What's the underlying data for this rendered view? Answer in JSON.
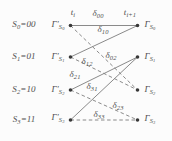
{
  "figure": {
    "background": "#fcfcfc",
    "colors": {
      "line": "#7d7d7d",
      "text": "#4f4f4f",
      "node": "#383838"
    },
    "node_radius": 1.8,
    "nodes": [
      {
        "name": "node-prev-s0",
        "x": 70.5,
        "y": 25.5
      },
      {
        "name": "node-prev-s1",
        "x": 70.5,
        "y": 57
      },
      {
        "name": "node-prev-s2",
        "x": 70.5,
        "y": 90
      },
      {
        "name": "node-prev-s3",
        "x": 70.5,
        "y": 120
      },
      {
        "name": "node-next-s0",
        "x": 137.5,
        "y": 25.5
      },
      {
        "name": "node-next-s1",
        "x": 137.5,
        "y": 57
      },
      {
        "name": "node-next-s2",
        "x": 137.5,
        "y": 90
      },
      {
        "name": "node-next-s3",
        "x": 137.5,
        "y": 120
      }
    ],
    "edges": [
      {
        "name": "branch-s0-s0",
        "metric": "δ00",
        "x1": 70.5,
        "y1": 25.5,
        "x2": 137.5,
        "y2": 25.5,
        "style": "solid"
      },
      {
        "name": "branch-s1-s0",
        "metric": "δ10",
        "x1": 70.5,
        "y1": 57,
        "x2": 137.5,
        "y2": 25.5,
        "style": "solid"
      },
      {
        "name": "branch-s0-s2",
        "metric": "δ02",
        "x1": 70.5,
        "y1": 25.5,
        "x2": 137.5,
        "y2": 90,
        "style": "dashed"
      },
      {
        "name": "branch-s1-s2",
        "metric": "δ12",
        "x1": 70.5,
        "y1": 57,
        "x2": 137.5,
        "y2": 90,
        "style": "dashed"
      },
      {
        "name": "branch-s2-s1",
        "metric": "δ21",
        "x1": 70.5,
        "y1": 90,
        "x2": 137.5,
        "y2": 57,
        "style": "solid"
      },
      {
        "name": "branch-s3-s1",
        "metric": "δ31",
        "x1": 70.5,
        "y1": 120,
        "x2": 137.5,
        "y2": 57,
        "style": "solid"
      },
      {
        "name": "branch-s2-s3",
        "metric": "δ23",
        "x1": 70.5,
        "y1": 90,
        "x2": 137.5,
        "y2": 120,
        "style": "dashed"
      },
      {
        "name": "branch-s3-s3",
        "metric": "δ33",
        "x1": 70.5,
        "y1": 120,
        "x2": 137.5,
        "y2": 120,
        "style": "dashed"
      }
    ],
    "labels": [
      {
        "name": "state-label-s0",
        "x": 24,
        "y": 25,
        "parts": [
          {
            "t": "S"
          },
          {
            "t": "0",
            "s": 1
          },
          {
            "t": "=00"
          }
        ]
      },
      {
        "name": "state-label-s1",
        "x": 24,
        "y": 57,
        "parts": [
          {
            "t": "S"
          },
          {
            "t": "1",
            "s": 1
          },
          {
            "t": "=01"
          }
        ]
      },
      {
        "name": "state-label-s2",
        "x": 24,
        "y": 90,
        "parts": [
          {
            "t": "S"
          },
          {
            "t": "2",
            "s": 1
          },
          {
            "t": "=10"
          }
        ]
      },
      {
        "name": "state-label-s3",
        "x": 24,
        "y": 120,
        "parts": [
          {
            "t": "S"
          },
          {
            "t": "3",
            "s": 1
          },
          {
            "t": "=11"
          }
        ]
      },
      {
        "name": "metric-prev-s0",
        "x": 58,
        "y": 26,
        "parts": [
          {
            "t": "Γ′"
          },
          {
            "t": "S",
            "s": 1
          },
          {
            "t": "0",
            "s": 2
          }
        ]
      },
      {
        "name": "metric-prev-s1",
        "x": 58,
        "y": 58,
        "parts": [
          {
            "t": "Γ′"
          },
          {
            "t": "S",
            "s": 1
          },
          {
            "t": "1",
            "s": 2
          }
        ]
      },
      {
        "name": "metric-prev-s2",
        "x": 58,
        "y": 91,
        "parts": [
          {
            "t": "Γ′"
          },
          {
            "t": "S",
            "s": 1
          },
          {
            "t": "2",
            "s": 2
          }
        ]
      },
      {
        "name": "metric-prev-s3",
        "x": 58,
        "y": 119,
        "parts": [
          {
            "t": "Γ′"
          },
          {
            "t": "S",
            "s": 1
          },
          {
            "t": "3",
            "s": 2
          }
        ]
      },
      {
        "name": "metric-next-s0",
        "x": 150,
        "y": 26,
        "parts": [
          {
            "t": "Γ"
          },
          {
            "t": "S",
            "s": 1
          },
          {
            "t": "0",
            "s": 2
          }
        ]
      },
      {
        "name": "metric-next-s1",
        "x": 150,
        "y": 58,
        "parts": [
          {
            "t": "Γ"
          },
          {
            "t": "S",
            "s": 1
          },
          {
            "t": "1",
            "s": 2
          }
        ]
      },
      {
        "name": "metric-next-s2",
        "x": 150,
        "y": 91,
        "parts": [
          {
            "t": "Γ"
          },
          {
            "t": "S",
            "s": 1
          },
          {
            "t": "2",
            "s": 2
          }
        ]
      },
      {
        "name": "metric-next-s3",
        "x": 150,
        "y": 120,
        "parts": [
          {
            "t": "Γ"
          },
          {
            "t": "S",
            "s": 1
          },
          {
            "t": "3",
            "s": 2
          }
        ]
      },
      {
        "name": "time-label-i",
        "x": 73,
        "y": 13,
        "parts": [
          {
            "t": "t"
          },
          {
            "t": "i",
            "s": 1
          }
        ]
      },
      {
        "name": "time-label-i-plus",
        "x": 130,
        "y": 13,
        "parts": [
          {
            "t": "t"
          },
          {
            "t": "i+1",
            "s": 1
          }
        ]
      },
      {
        "name": "branch-metric-00",
        "x": 98,
        "y": 14,
        "parts": [
          {
            "t": "δ"
          },
          {
            "t": "00",
            "s": 1
          }
        ]
      },
      {
        "name": "branch-metric-10",
        "x": 103,
        "y": 30,
        "parts": [
          {
            "t": "δ"
          },
          {
            "t": "10",
            "s": 1
          }
        ]
      },
      {
        "name": "branch-metric-02",
        "x": 111,
        "y": 56,
        "parts": [
          {
            "t": "δ"
          },
          {
            "t": "02",
            "s": 1
          }
        ]
      },
      {
        "name": "branch-metric-12",
        "x": 87,
        "y": 62,
        "parts": [
          {
            "t": "δ"
          },
          {
            "t": "12",
            "s": 1
          }
        ]
      },
      {
        "name": "branch-metric-21",
        "x": 75,
        "y": 75,
        "parts": [
          {
            "t": "δ"
          },
          {
            "t": "21",
            "s": 1
          }
        ]
      },
      {
        "name": "branch-metric-31",
        "x": 92,
        "y": 87,
        "parts": [
          {
            "t": "δ"
          },
          {
            "t": "31",
            "s": 1
          }
        ]
      },
      {
        "name": "branch-metric-23",
        "x": 118,
        "y": 106,
        "parts": [
          {
            "t": "δ"
          },
          {
            "t": "23",
            "s": 1
          }
        ]
      },
      {
        "name": "branch-metric-33",
        "x": 99,
        "y": 115,
        "parts": [
          {
            "t": "δ"
          },
          {
            "t": "33",
            "s": 1
          }
        ]
      }
    ]
  }
}
